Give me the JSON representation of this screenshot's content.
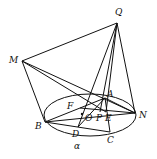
{
  "figure": {
    "type": "geometry-3d",
    "points": {
      "Q": {
        "label": "Q",
        "x": 117,
        "y": 23,
        "lx": 115,
        "ly": 15
      },
      "M": {
        "label": "M",
        "x": 22,
        "y": 61,
        "lx": 9,
        "ly": 63
      },
      "A": {
        "label": "A",
        "x": 105,
        "y": 98,
        "lx": 107,
        "ly": 97
      },
      "N": {
        "label": "N",
        "x": 135,
        "y": 113,
        "lx": 139,
        "ly": 118
      },
      "B": {
        "label": "B",
        "x": 45,
        "y": 122,
        "lx": 35,
        "ly": 129
      },
      "C": {
        "label": "C",
        "x": 110,
        "y": 132,
        "lx": 107,
        "ly": 143
      },
      "D": {
        "label": "D",
        "x": 78,
        "y": 127,
        "lx": 72,
        "ly": 137
      },
      "F": {
        "label": "F",
        "x": 80,
        "y": 108,
        "lx": 67,
        "ly": 109
      },
      "O": {
        "label": "O",
        "x": 82,
        "y": 114,
        "lx": 85,
        "ly": 121
      },
      "P": {
        "label": "P",
        "x": 100,
        "y": 112,
        "lx": 96,
        "ly": 121
      },
      "E": {
        "label": "E",
        "x": 106,
        "y": 112,
        "lx": 105,
        "ly": 121
      }
    },
    "plane_label": {
      "label": "α",
      "x": 74,
      "y": 149
    },
    "ellipse": {
      "cx": 90,
      "cy": 115,
      "rx": 46,
      "ry": 21
    },
    "segments": [
      [
        "Q",
        "M"
      ],
      [
        "Q",
        "N"
      ],
      [
        "Q",
        "D"
      ],
      [
        "Q",
        "P"
      ],
      [
        "Q",
        "E"
      ],
      [
        "M",
        "B"
      ],
      [
        "M",
        "N"
      ],
      [
        "M",
        "E"
      ],
      [
        "B",
        "A"
      ],
      [
        "B",
        "N"
      ],
      [
        "B",
        "C"
      ],
      [
        "A",
        "C"
      ],
      [
        "A",
        "N"
      ],
      [
        "A",
        "D"
      ],
      [
        "F",
        "N"
      ]
    ]
  }
}
